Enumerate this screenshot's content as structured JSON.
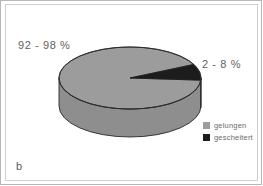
{
  "figure": {
    "letter": "b",
    "background_color": "#ffffff",
    "frame_color": "#b7b7b7",
    "inner_frame_color": "#cfcfcf"
  },
  "labels": {
    "major": "92 - 98 %",
    "minor": "2 - 8 %",
    "text_color": "#5f5f5f"
  },
  "legend": {
    "items": [
      {
        "label": "gelungen",
        "color": "#9c9c9c"
      },
      {
        "label": "gescheitert",
        "color": "#1c1c1c"
      }
    ]
  },
  "chart_data": {
    "type": "pie",
    "title": "",
    "subtitle": "",
    "xlabel": "",
    "ylabel": "",
    "three_d": true,
    "legend_position": "bottom-right",
    "grid": false,
    "categories": [
      "gelungen",
      "gescheitert"
    ],
    "values": [
      95,
      5
    ],
    "value_ranges": [
      {
        "name": "gelungen",
        "min": 92,
        "max": 98,
        "unit": "%",
        "label": "92 - 98 %"
      },
      {
        "name": "gescheitert",
        "min": 2,
        "max": 8,
        "unit": "%",
        "label": "2 - 8 %"
      }
    ],
    "series": [
      {
        "name": "Ergebnis",
        "values": [
          95,
          5
        ],
        "colors": [
          "#9c9c9c",
          "#1c1c1c"
        ]
      }
    ],
    "annotations": [
      "92 - 98 %",
      "2 - 8 %",
      "b"
    ]
  },
  "geometry": {
    "center_x": 130,
    "center_y": 78,
    "radius_x": 71,
    "radius_y": 31,
    "depth": 28,
    "minor_start_deg": -26,
    "minor_end_deg": 4,
    "top_face_color": "#9c9c9c",
    "side_face_color": "#8e8e8e",
    "dark_slice_color": "#1c1c1c",
    "outline_color": "#2a2a2a"
  }
}
